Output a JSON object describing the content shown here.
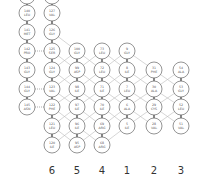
{
  "diagram": {
    "type": "beta-sheet-topology",
    "colors": {
      "node_stroke": "#666666",
      "node_fill": "#ffffff",
      "backbone": "#555555",
      "hbond": "#bbbbbb",
      "dotted": "#888888",
      "label": "#333333"
    },
    "node_radius": 8,
    "strands": [
      {
        "label": "",
        "x": 27,
        "residues": [
          {
            "num": "",
            "res": "",
            "y": -4
          },
          {
            "num": "140",
            "res": "LEU",
            "y": 13
          },
          {
            "num": "141",
            "res": "MET",
            "y": 32
          },
          {
            "num": "142",
            "res": "PRO",
            "y": 51
          },
          {
            "num": "143",
            "res": "GLY",
            "y": 70
          },
          {
            "num": "144",
            "res": "GLY",
            "y": 89
          },
          {
            "num": "145",
            "res": "ASN",
            "y": 107
          }
        ]
      },
      {
        "label": "6",
        "x": 52,
        "residues": [
          {
            "num": "",
            "res": "",
            "y": -4
          },
          {
            "num": "127",
            "res": "VAL",
            "y": 13
          },
          {
            "num": "126",
            "res": "GLY",
            "y": 32
          },
          {
            "num": "125",
            "res": "SER",
            "y": 51
          },
          {
            "num": "124",
            "res": "GLY",
            "y": 70
          },
          {
            "num": "123",
            "res": "VAL",
            "y": 89
          },
          {
            "num": "122",
            "res": "PHE",
            "y": 107
          },
          {
            "num": "121",
            "res": "LEU",
            "y": 126
          },
          {
            "num": "120",
            "res": "ILE",
            "y": 145
          }
        ]
      },
      {
        "label": "5",
        "x": 77,
        "residues": [
          {
            "num": "100",
            "res": "GLY",
            "y": 51
          },
          {
            "num": "99",
            "res": "ASP",
            "y": 70
          },
          {
            "num": "98",
            "res": "ILE",
            "y": 89
          },
          {
            "num": "97",
            "res": "ILE",
            "y": 107
          },
          {
            "num": "96",
            "res": "ILE",
            "y": 126
          },
          {
            "num": "95",
            "res": "ASP",
            "y": 145
          }
        ]
      },
      {
        "label": "4",
        "x": 102,
        "residues": [
          {
            "num": "73",
            "res": "LEU",
            "y": 51
          },
          {
            "num": "72",
            "res": "LEU",
            "y": 70
          },
          {
            "num": "71",
            "res": "ILE",
            "y": 89
          },
          {
            "num": "70",
            "res": "ILE",
            "y": 107
          },
          {
            "num": "69",
            "res": "ARG",
            "y": 126
          },
          {
            "num": "68",
            "res": "ARG",
            "y": 145
          }
        ]
      },
      {
        "label": "1",
        "x": 127,
        "residues": [
          {
            "num": "9",
            "res": "GLY",
            "y": 51
          },
          {
            "num": "8",
            "res": "ILE",
            "y": 70
          },
          {
            "num": "7",
            "res": "LEU",
            "y": 89
          },
          {
            "num": "6",
            "res": "ALA",
            "y": 107
          },
          {
            "num": "5",
            "res": "ILE",
            "y": 126
          }
        ]
      },
      {
        "label": "2",
        "x": 154,
        "residues": [
          {
            "num": "31",
            "res": "PHE",
            "y": 70
          },
          {
            "num": "30",
            "res": "ALA",
            "y": 89
          },
          {
            "num": "29",
            "res": "CYS",
            "y": 107
          },
          {
            "num": "28",
            "res": "VAL",
            "y": 126
          }
        ]
      },
      {
        "label": "3",
        "x": 181,
        "residues": [
          {
            "num": "54",
            "res": "ALA",
            "y": 70
          },
          {
            "num": "53",
            "res": "GLY",
            "y": 89
          },
          {
            "num": "52",
            "res": "LEU",
            "y": 107
          },
          {
            "num": "51",
            "res": "VAL",
            "y": 126
          }
        ]
      }
    ],
    "dotted_pairs": [
      {
        "from": [
          0,
          3
        ],
        "to": [
          1,
          3
        ]
      },
      {
        "from": [
          0,
          5
        ],
        "to": [
          1,
          5
        ]
      },
      {
        "from": [
          0,
          6
        ],
        "to": [
          1,
          6
        ]
      }
    ],
    "column_label_y": 174
  }
}
